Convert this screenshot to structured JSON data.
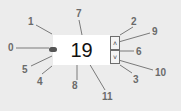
{
  "widget": {
    "value": "19",
    "up_icon": "˄",
    "down_icon": "˅"
  },
  "callouts": [
    {
      "id": "0",
      "label": "0",
      "x": 8,
      "y": 43
    },
    {
      "id": "1",
      "label": "1",
      "x": 28,
      "y": 17
    },
    {
      "id": "2",
      "label": "2",
      "x": 131,
      "y": 17
    },
    {
      "id": "3",
      "label": "3",
      "x": 133,
      "y": 75
    },
    {
      "id": "4",
      "label": "4",
      "x": 37,
      "y": 77
    },
    {
      "id": "5",
      "label": "5",
      "x": 22,
      "y": 65
    },
    {
      "id": "6",
      "label": "6",
      "x": 136,
      "y": 47
    },
    {
      "id": "7",
      "label": "7",
      "x": 76,
      "y": 9
    },
    {
      "id": "8",
      "label": "8",
      "x": 72,
      "y": 81
    },
    {
      "id": "9",
      "label": "9",
      "x": 152,
      "y": 27
    },
    {
      "id": "10",
      "label": "10",
      "x": 155,
      "y": 68
    },
    {
      "id": "11",
      "label": "11",
      "x": 102,
      "y": 92
    }
  ],
  "colors": {
    "background": "#ececec",
    "field": "#ffffff",
    "callout_text": "#6a6a6a",
    "leader_line": "#7a7a7a"
  }
}
